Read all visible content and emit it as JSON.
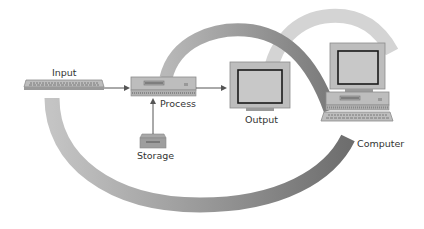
{
  "diagram": {
    "type": "information-processing-cycle",
    "nodes": [
      {
        "id": "input",
        "label": "Input",
        "device": "keyboard"
      },
      {
        "id": "process",
        "label": "Process",
        "device": "system-unit"
      },
      {
        "id": "output",
        "label": "Output",
        "device": "monitor"
      },
      {
        "id": "storage",
        "label": "Storage",
        "device": "disk-drive"
      },
      {
        "id": "computer",
        "label": "Computer",
        "device": "desktop-computer"
      }
    ],
    "edges": [
      {
        "from": "input",
        "to": "process"
      },
      {
        "from": "process",
        "to": "output"
      },
      {
        "from": "storage",
        "to": "process"
      }
    ],
    "colors": {
      "band_dark": "#8a8a8a",
      "band_light": "#d2d2d2",
      "device_body": "#b8b8b8",
      "device_edge": "#8c8c8c",
      "screen": "#c8c8c8",
      "screen_border": "#1a1a1a",
      "arrow": "#555555",
      "text": "#333333"
    }
  }
}
